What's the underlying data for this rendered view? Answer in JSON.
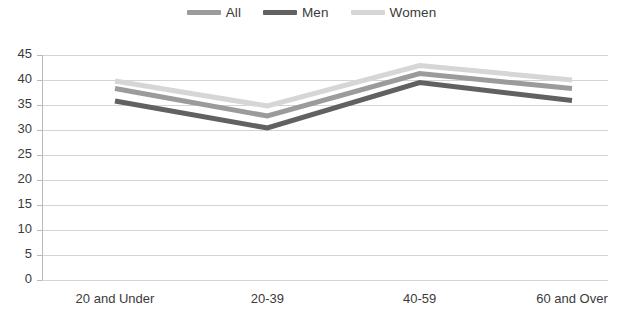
{
  "chart_data": {
    "type": "line",
    "title": "",
    "subtitle": "",
    "xlabel": "",
    "ylabel": "",
    "categories": [
      "20 and Under",
      "20-39",
      "40-59",
      "60 and Over"
    ],
    "series": [
      {
        "name": "All",
        "values": [
          38.3,
          32.8,
          41.3,
          38.3
        ],
        "color": "#9b9b9b"
      },
      {
        "name": "Men",
        "values": [
          35.8,
          30.4,
          39.5,
          35.9
        ],
        "color": "#616161"
      },
      {
        "name": "Women",
        "values": [
          39.8,
          34.8,
          42.9,
          40.0
        ],
        "color": "#d6d6d6"
      }
    ],
    "ylim": [
      0,
      45
    ],
    "yticks": [
      0,
      5,
      10,
      15,
      20,
      25,
      30,
      35,
      40,
      45
    ],
    "ytick_labels": [
      "0",
      "5",
      "10",
      "15",
      "20",
      "25",
      "30",
      "35",
      "40",
      "45"
    ],
    "grid": true,
    "grid_axis": "y",
    "legend_position": "top-center",
    "legend": [
      "All",
      "Men",
      "Women"
    ]
  },
  "legend": {
    "items": [
      {
        "label": "All",
        "color": "#9b9b9b"
      },
      {
        "label": "Men",
        "color": "#616161"
      },
      {
        "label": "Women",
        "color": "#d6d6d6"
      }
    ]
  },
  "axes": {
    "y_tick_labels": [
      "45",
      "40",
      "35",
      "30",
      "25",
      "20",
      "15",
      "10",
      "5",
      "0"
    ],
    "x_tick_labels": [
      "20 and Under",
      "20-39",
      "40-59",
      "60 and Over"
    ]
  }
}
